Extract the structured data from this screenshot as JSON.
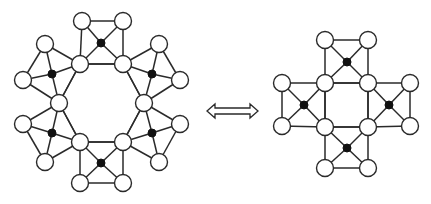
{
  "figure": {
    "relation_symbol": "double-arrow (equivalence)",
    "colors": {
      "line": "#2a2a2a",
      "open_node": "#ffffff",
      "filled_node": "#111111"
    }
  },
  "left_graph": {
    "name": "hexagonal ring of six gadgets",
    "ring_nodes": 6,
    "gadgets": 6,
    "gadget_structure": "4 open vertices forming a quadrilateral with a filled center vertex adjacent to all four",
    "open_vertices": 18,
    "filled_vertices": 6
  },
  "right_graph": {
    "name": "square ring of four gadgets",
    "ring_nodes": 4,
    "gadgets": 4,
    "gadget_structure": "4 open vertices forming a quadrilateral with a filled center vertex adjacent to all four",
    "open_vertices": 12,
    "filled_vertices": 4
  }
}
